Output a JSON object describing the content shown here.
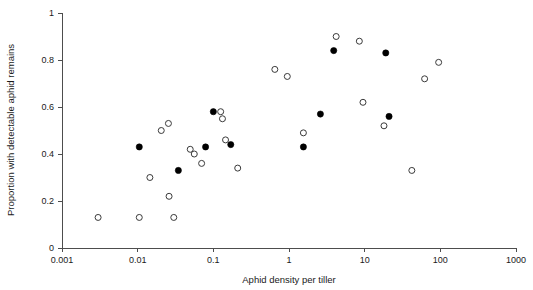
{
  "chart_data": {
    "type": "scatter",
    "title": "",
    "xlabel": "Aphid density per tiller",
    "ylabel": "Proportion with detectable aphid remains",
    "xscale": "log",
    "xlim": [
      0.001,
      1000
    ],
    "ylim": [
      0,
      1
    ],
    "grid": false,
    "legend": "none",
    "xticks": [
      "0.001",
      "0.01",
      "0.1",
      "1",
      "10",
      "100",
      "1000"
    ],
    "xtick_values": [
      0.001,
      0.01,
      0.1,
      1,
      10,
      100,
      1000
    ],
    "yticks": [
      "0",
      "0.2",
      "0.4",
      "0.6",
      "0.8",
      "1"
    ],
    "ytick_values": [
      0,
      0.2,
      0.4,
      0.6,
      0.8,
      1
    ],
    "series": [
      {
        "name": "open-circles",
        "marker": "open-circle",
        "color": "#3a3a3a",
        "points": [
          {
            "x": 0.003,
            "y": 0.13
          },
          {
            "x": 0.0105,
            "y": 0.13
          },
          {
            "x": 0.0145,
            "y": 0.3
          },
          {
            "x": 0.0205,
            "y": 0.5
          },
          {
            "x": 0.0255,
            "y": 0.53
          },
          {
            "x": 0.026,
            "y": 0.22
          },
          {
            "x": 0.03,
            "y": 0.13
          },
          {
            "x": 0.0495,
            "y": 0.42
          },
          {
            "x": 0.056,
            "y": 0.4
          },
          {
            "x": 0.07,
            "y": 0.36
          },
          {
            "x": 0.125,
            "y": 0.58
          },
          {
            "x": 0.132,
            "y": 0.55
          },
          {
            "x": 0.145,
            "y": 0.46
          },
          {
            "x": 0.21,
            "y": 0.34
          },
          {
            "x": 0.65,
            "y": 0.76
          },
          {
            "x": 0.95,
            "y": 0.73
          },
          {
            "x": 1.55,
            "y": 0.49
          },
          {
            "x": 4.2,
            "y": 0.9
          },
          {
            "x": 8.5,
            "y": 0.88
          },
          {
            "x": 9.5,
            "y": 0.62
          },
          {
            "x": 18.0,
            "y": 0.52
          },
          {
            "x": 42.0,
            "y": 0.33
          },
          {
            "x": 62.0,
            "y": 0.72
          },
          {
            "x": 95.0,
            "y": 0.79
          }
        ]
      },
      {
        "name": "filled-circles",
        "marker": "filled-circle",
        "color": "#000000",
        "points": [
          {
            "x": 0.0105,
            "y": 0.43
          },
          {
            "x": 0.0345,
            "y": 0.33
          },
          {
            "x": 0.079,
            "y": 0.43
          },
          {
            "x": 0.1,
            "y": 0.58
          },
          {
            "x": 0.17,
            "y": 0.44
          },
          {
            "x": 1.55,
            "y": 0.43
          },
          {
            "x": 2.6,
            "y": 0.57
          },
          {
            "x": 3.9,
            "y": 0.84
          },
          {
            "x": 19.0,
            "y": 0.83
          },
          {
            "x": 21.0,
            "y": 0.56
          }
        ]
      }
    ]
  }
}
